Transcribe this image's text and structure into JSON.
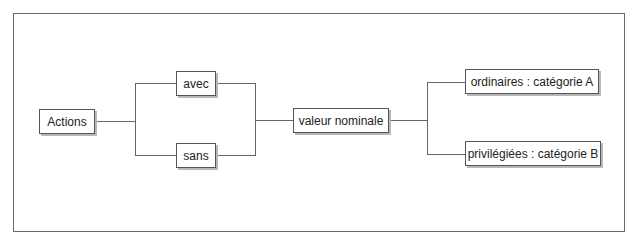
{
  "diagram": {
    "type": "tree",
    "root": {
      "label": "Actions"
    },
    "branch1": [
      {
        "label": "avec"
      },
      {
        "label": "sans"
      }
    ],
    "middle": {
      "label": "valeur nominale"
    },
    "branch2": [
      {
        "label": "ordinaires : catégorie A"
      },
      {
        "label": "privilégiées : catégorie B"
      }
    ],
    "edges": [
      [
        "Actions",
        "avec"
      ],
      [
        "Actions",
        "sans"
      ],
      [
        "avec",
        "valeur nominale"
      ],
      [
        "sans",
        "valeur nominale"
      ],
      [
        "valeur nominale",
        "ordinaires : catégorie A"
      ],
      [
        "valeur nominale",
        "privilégiées : catégorie B"
      ]
    ]
  }
}
